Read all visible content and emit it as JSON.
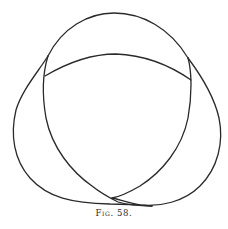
{
  "figure": {
    "caption": "Fig. 58.",
    "stroke_color": "#2a2a2a",
    "background": "#ffffff"
  }
}
